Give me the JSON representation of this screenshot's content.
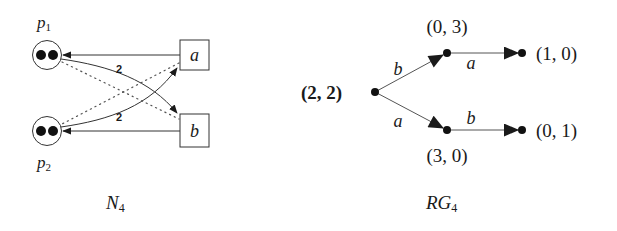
{
  "petri_net": {
    "caption_base": "N",
    "caption_sub": "4",
    "places": [
      {
        "id": "p1",
        "label_base": "p",
        "label_sub": "1",
        "tokens": 2
      },
      {
        "id": "p2",
        "label_base": "p",
        "label_sub": "2",
        "tokens": 2
      }
    ],
    "transitions": [
      {
        "id": "a",
        "label": "a"
      },
      {
        "id": "b",
        "label": "b"
      }
    ],
    "arcs": [
      {
        "from": "a",
        "to": "p1",
        "style": "solid",
        "weight": ""
      },
      {
        "from": "b",
        "to": "p2",
        "style": "solid",
        "weight": ""
      },
      {
        "from": "p1",
        "to": "b",
        "style": "solid-curved",
        "weight": "2"
      },
      {
        "from": "p2",
        "to": "a",
        "style": "solid-curved",
        "weight": "2"
      },
      {
        "from": "p1",
        "to": "b",
        "style": "dotted",
        "weight": ""
      },
      {
        "from": "a",
        "to": "p2",
        "style": "dotted",
        "weight": ""
      }
    ],
    "weight_labels": [
      "2",
      "2"
    ]
  },
  "reachability_graph": {
    "caption_base": "RG",
    "caption_sub": "4",
    "nodes": [
      {
        "id": "n0",
        "label": "(2, 2)",
        "initial": true
      },
      {
        "id": "n1",
        "label": "(0, 3)"
      },
      {
        "id": "n2",
        "label": "(1, 0)"
      },
      {
        "id": "n3",
        "label": "(3, 0)"
      },
      {
        "id": "n4",
        "label": "(0, 1)"
      }
    ],
    "edges": [
      {
        "from": "n0",
        "to": "n1",
        "label": "b"
      },
      {
        "from": "n1",
        "to": "n2",
        "label": "a"
      },
      {
        "from": "n0",
        "to": "n3",
        "label": "a"
      },
      {
        "from": "n3",
        "to": "n4",
        "label": "b"
      }
    ]
  }
}
